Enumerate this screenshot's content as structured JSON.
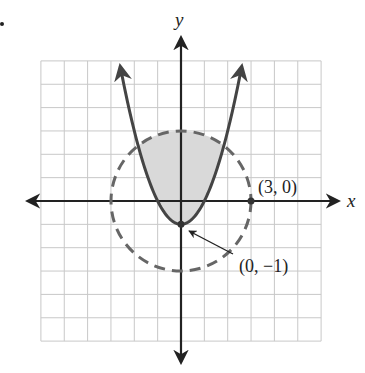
{
  "chart_data": {
    "type": "line",
    "title": "",
    "xlabel": "x",
    "ylabel": "y",
    "xlim": [
      -6,
      6
    ],
    "ylim": [
      -6,
      6
    ],
    "grid": true,
    "grid_step": 1,
    "legend": null,
    "series": [
      {
        "name": "parabola",
        "equation": "y = x^2 - 1",
        "style": "solid",
        "color": "#444444",
        "arrows": "both-ends",
        "vertex": [
          0,
          -1
        ],
        "x": [
          -2.6,
          -2,
          -1.5,
          -1,
          -0.5,
          0,
          0.5,
          1,
          1.5,
          2,
          2.6
        ],
        "y": [
          5.76,
          3,
          1.25,
          0,
          -0.75,
          -1,
          -0.75,
          0,
          1.25,
          3,
          5.76
        ]
      },
      {
        "name": "circle",
        "equation": "x^2 + y^2 = 9",
        "style": "dashed",
        "color": "#666666",
        "center": [
          0,
          0
        ],
        "radius": 3
      }
    ],
    "shaded_region": {
      "description": "inside circle and above parabola",
      "inequalities": [
        "y > x^2 - 1",
        "x^2 + y^2 < 9"
      ],
      "color": "#d9d9d9"
    },
    "annotations": [
      {
        "text": "(3, 0)",
        "point": [
          3,
          0
        ],
        "marker": "dot"
      },
      {
        "text": "(0, −1)",
        "point": [
          0,
          -1
        ],
        "marker": "dot",
        "arrow": true
      }
    ]
  },
  "labels": {
    "x_axis": "x",
    "y_axis": "y",
    "point_a": "(3, 0)",
    "point_b": "(0, −1)"
  },
  "colors": {
    "grid": "#c8c8c8",
    "axis": "#222222",
    "parabola": "#444444",
    "circle": "#666666",
    "shade": "#d9d9d9"
  }
}
